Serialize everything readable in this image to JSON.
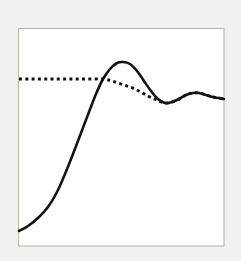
{
  "figure": {
    "title": "",
    "background_color": "#f2f1ee",
    "plot_background_color": "#ffffff",
    "frame_color": "#b9b8b3",
    "curve_color": "#14120f"
  },
  "chart_data": {
    "type": "line",
    "title": "",
    "subtitle": "",
    "xlabel": "",
    "ylabel": "",
    "xlim": [
      0,
      100
    ],
    "ylim": [
      0,
      100
    ],
    "grid": false,
    "legend": false,
    "legend_position": "none",
    "axis_ticks": [],
    "xtick_labels": [],
    "ytick_labels": [],
    "annotations": [],
    "series": [
      {
        "name": "solid-curve",
        "style": "solid",
        "color": "#14120f",
        "x": [
          0,
          5,
          10,
          15,
          20,
          25,
          30,
          35,
          40,
          45,
          50,
          55,
          60,
          65,
          70,
          75,
          80,
          85,
          90,
          95,
          100
        ],
        "y": [
          8,
          10,
          13,
          18,
          26,
          37,
          50,
          63,
          75,
          84,
          88,
          86,
          79,
          70,
          65,
          64,
          67,
          70,
          71,
          70,
          68
        ],
        "path_points": [
          [
            19,
            231
          ],
          [
            28,
            226
          ],
          [
            38,
            218
          ],
          [
            48,
            207
          ],
          [
            57,
            192
          ],
          [
            65,
            174
          ],
          [
            73,
            154
          ],
          [
            81,
            133
          ],
          [
            89,
            112
          ],
          [
            96,
            94
          ],
          [
            103,
            79
          ],
          [
            110,
            69
          ],
          [
            117,
            63
          ],
          [
            123,
            62
          ],
          [
            130,
            64
          ],
          [
            137,
            71
          ],
          [
            144,
            81
          ],
          [
            151,
            91
          ],
          [
            158,
            99
          ],
          [
            165,
            103
          ],
          [
            172,
            102
          ],
          [
            179,
            99
          ],
          [
            186,
            95
          ],
          [
            193,
            93
          ],
          [
            199,
            93
          ],
          [
            206,
            95
          ],
          [
            213,
            97
          ],
          [
            224,
            99
          ]
        ]
      },
      {
        "name": "dotted-curve",
        "style": "dotted",
        "color": "#14120f",
        "x": [
          0,
          5,
          10,
          15,
          20,
          25,
          30,
          35,
          40,
          45,
          50,
          55,
          60,
          65,
          70,
          75,
          80,
          85,
          90,
          95,
          100
        ],
        "y": [
          70,
          70,
          70,
          70,
          70,
          70,
          70,
          69,
          68,
          66,
          64,
          63,
          64,
          65,
          67,
          70,
          71,
          70,
          69,
          68,
          68
        ],
        "path_points": [
          [
            19,
            79
          ],
          [
            31,
            79
          ],
          [
            43,
            79
          ],
          [
            55,
            79
          ],
          [
            67,
            79
          ],
          [
            79,
            79
          ],
          [
            91,
            79
          ],
          [
            103,
            79
          ],
          [
            112,
            81
          ],
          [
            121,
            84
          ],
          [
            130,
            87
          ],
          [
            139,
            91
          ],
          [
            148,
            96
          ],
          [
            157,
            100
          ],
          [
            165,
            103
          ],
          [
            172,
            102
          ],
          [
            179,
            99
          ],
          [
            186,
            95
          ],
          [
            193,
            93
          ],
          [
            199,
            93
          ],
          [
            206,
            95
          ],
          [
            213,
            97
          ],
          [
            224,
            99
          ]
        ]
      }
    ]
  }
}
